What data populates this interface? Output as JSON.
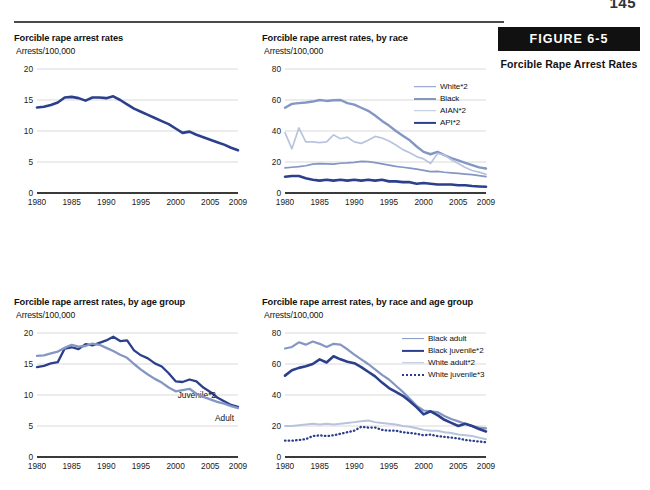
{
  "page": {
    "folio": "145"
  },
  "figure": {
    "bar_label": "FIGURE 6-5",
    "caption": "Forcible Rape Arrest Rates"
  },
  "colors": {
    "dark_navy": "#2B3F8C",
    "medium_blue": "#8496C4",
    "light_blue": "#B8C4DE",
    "axis": "#3a3a3a",
    "gridline": "#d9d9d9"
  },
  "charts": [
    {
      "id": "overall",
      "title": "Forcible rape arrest rates",
      "subtitle": "Arrests/100,000",
      "chart_data": {
        "type": "line",
        "title": "Forcible rape arrest rates",
        "xlabel": "",
        "ylabel": "Arrests/100,000",
        "xlim": [
          1980,
          2009
        ],
        "ylim": [
          0,
          20
        ],
        "yticks": [
          0,
          5,
          10,
          15,
          20
        ],
        "xticks": [
          1980,
          1985,
          1990,
          1995,
          2000,
          2005,
          2009
        ],
        "grid": true,
        "legend": "none",
        "x": [
          1980,
          1981,
          1982,
          1983,
          1984,
          1985,
          1986,
          1987,
          1988,
          1989,
          1990,
          1991,
          1992,
          1993,
          1994,
          1995,
          1996,
          1997,
          1998,
          1999,
          2000,
          2001,
          2002,
          2003,
          2004,
          2005,
          2006,
          2007,
          2008,
          2009
        ],
        "series": [
          {
            "name": "All",
            "color": "#2B3F8C",
            "style": "solid",
            "width": 2.6,
            "values": [
              13.8,
              13.9,
              14.2,
              14.6,
              15.4,
              15.5,
              15.3,
              14.9,
              15.4,
              15.4,
              15.3,
              15.6,
              15.0,
              14.3,
              13.6,
              13.1,
              12.6,
              12.1,
              11.6,
              11.1,
              10.4,
              9.7,
              9.9,
              9.4,
              9.0,
              8.6,
              8.2,
              7.8,
              7.3,
              6.9
            ]
          }
        ]
      }
    },
    {
      "id": "by-race",
      "title": "Forcible rape arrest rates, by race",
      "subtitle": "Arrests/100,000",
      "chart_data": {
        "type": "line",
        "title": "Forcible rape arrest rates, by race",
        "xlabel": "",
        "ylabel": "Arrests/100,000",
        "xlim": [
          1980,
          2009
        ],
        "ylim": [
          0,
          80
        ],
        "yticks": [
          0,
          20,
          40,
          60,
          80
        ],
        "xticks": [
          1980,
          1985,
          1990,
          1995,
          2000,
          2005,
          2009
        ],
        "grid": true,
        "legend": "top-right",
        "x": [
          1980,
          1981,
          1982,
          1983,
          1984,
          1985,
          1986,
          1987,
          1988,
          1989,
          1990,
          1991,
          1992,
          1993,
          1994,
          1995,
          1996,
          1997,
          1998,
          1999,
          2000,
          2001,
          2002,
          2003,
          2004,
          2005,
          2006,
          2007,
          2008,
          2009
        ],
        "series": [
          {
            "name": "White*2",
            "color": "#8496C4",
            "style": "solid",
            "width": 1.7,
            "values": [
              16.2,
              16.6,
              17.0,
              17.6,
              18.6,
              19.0,
              18.8,
              18.6,
              19.2,
              19.4,
              19.8,
              20.4,
              20.2,
              19.6,
              18.8,
              18.0,
              17.2,
              16.6,
              16.0,
              15.4,
              14.6,
              13.8,
              14.0,
              13.4,
              13.0,
              12.6,
              12.2,
              11.8,
              11.2,
              10.6
            ]
          },
          {
            "name": "Black",
            "color": "#8496C4",
            "style": "solid",
            "width": 2.4,
            "values": [
              55.0,
              57.5,
              58.0,
              58.4,
              59.0,
              60.0,
              59.4,
              59.8,
              60.0,
              58.0,
              57.0,
              55.0,
              53.0,
              50.0,
              46.5,
              43.5,
              40.0,
              37.0,
              34.0,
              30.0,
              26.5,
              25.0,
              26.5,
              24.5,
              22.5,
              21.0,
              19.5,
              18.0,
              16.5,
              15.8
            ]
          },
          {
            "name": "AIAN*2",
            "color": "#B8C4DE",
            "style": "solid",
            "width": 1.7,
            "values": [
              39.0,
              28.5,
              42.0,
              33.0,
              33.0,
              32.5,
              33.0,
              37.5,
              35.0,
              36.0,
              33.0,
              32.0,
              34.0,
              36.5,
              35.5,
              33.5,
              31.0,
              28.0,
              26.0,
              23.5,
              22.0,
              19.0,
              25.5,
              24.5,
              21.5,
              19.0,
              16.5,
              14.5,
              13.5,
              12.0
            ]
          },
          {
            "name": "API*2",
            "color": "#2B3F8C",
            "style": "solid",
            "width": 2.6,
            "values": [
              10.5,
              11.0,
              11.0,
              9.5,
              8.5,
              8.0,
              8.5,
              8.0,
              8.5,
              8.0,
              8.5,
              8.0,
              8.5,
              8.0,
              8.5,
              7.5,
              7.5,
              7.0,
              7.0,
              6.0,
              6.5,
              6.0,
              5.5,
              5.5,
              5.5,
              5.0,
              5.0,
              4.5,
              4.2,
              4.0
            ]
          }
        ]
      }
    },
    {
      "id": "by-age",
      "title": "Forcible rape arrest rates, by age group",
      "subtitle": "Arrests/100,000",
      "chart_data": {
        "type": "line",
        "title": "Forcible rape arrest rates, by age group",
        "xlabel": "",
        "ylabel": "Arrests/100,000",
        "xlim": [
          1980,
          2009
        ],
        "ylim": [
          0,
          20
        ],
        "yticks": [
          0,
          5,
          10,
          15,
          20
        ],
        "xticks": [
          1980,
          1985,
          1990,
          1995,
          2000,
          2005,
          2009
        ],
        "grid": true,
        "legend": "inline",
        "x": [
          1980,
          1981,
          1982,
          1983,
          1984,
          1985,
          1986,
          1987,
          1988,
          1989,
          1990,
          1991,
          1992,
          1993,
          1994,
          1995,
          1996,
          1997,
          1998,
          1999,
          2000,
          2001,
          2002,
          2003,
          2004,
          2005,
          2006,
          2007,
          2008,
          2009
        ],
        "series": [
          {
            "name": "Juvenile*2",
            "color": "#2B3F8C",
            "style": "solid",
            "width": 2.3,
            "label_inline": "Juvenile*2",
            "values": [
              14.5,
              14.7,
              15.1,
              15.3,
              17.5,
              17.7,
              17.4,
              18.2,
              18.0,
              18.4,
              18.8,
              19.4,
              18.7,
              18.8,
              17.2,
              16.4,
              15.9,
              15.1,
              14.6,
              13.5,
              12.2,
              12.1,
              12.5,
              12.2,
              11.2,
              10.5,
              9.6,
              9.0,
              8.4,
              8.1
            ]
          },
          {
            "name": "Adult",
            "color": "#8496C4",
            "style": "solid",
            "width": 2.3,
            "label_inline": "Adult",
            "values": [
              16.3,
              16.4,
              16.7,
              17.0,
              17.6,
              18.1,
              17.8,
              17.9,
              18.3,
              18.1,
              17.6,
              17.1,
              16.5,
              16.0,
              15.0,
              14.1,
              13.3,
              12.6,
              12.0,
              11.2,
              10.6,
              10.8,
              11.0,
              10.2,
              9.7,
              9.3,
              8.9,
              8.6,
              8.2,
              7.9
            ]
          }
        ]
      }
    },
    {
      "id": "by-race-age",
      "title": "Forcible rape arrest rates, by race and age group",
      "subtitle": "Arrests/100,000",
      "chart_data": {
        "type": "line",
        "title": "Forcible rape arrest rates, by race and age group",
        "xlabel": "",
        "ylabel": "Arrests/100,000",
        "xlim": [
          1980,
          2009
        ],
        "ylim": [
          0,
          80
        ],
        "yticks": [
          0,
          20,
          40,
          60,
          80
        ],
        "xticks": [
          1980,
          1985,
          1990,
          1995,
          2000,
          2005,
          2009
        ],
        "grid": true,
        "legend": "top-right",
        "x": [
          1980,
          1981,
          1982,
          1983,
          1984,
          1985,
          1986,
          1987,
          1988,
          1989,
          1990,
          1991,
          1992,
          1993,
          1994,
          1995,
          1996,
          1997,
          1998,
          1999,
          2000,
          2001,
          2002,
          2003,
          2004,
          2005,
          2006,
          2007,
          2008,
          2009
        ],
        "series": [
          {
            "name": "Black adult",
            "color": "#8496C4",
            "style": "solid",
            "width": 2.2,
            "values": [
              70.0,
              71.0,
              74.0,
              72.5,
              74.5,
              73.0,
              71.0,
              73.0,
              72.5,
              69.5,
              66.0,
              63.0,
              60.0,
              56.5,
              53.0,
              50.0,
              46.0,
              42.0,
              37.5,
              33.0,
              30.0,
              29.5,
              29.0,
              26.5,
              24.5,
              23.0,
              21.5,
              20.0,
              19.0,
              18.5
            ]
          },
          {
            "name": "Black juvenile*2",
            "color": "#2B3F8C",
            "style": "solid",
            "width": 2.6,
            "values": [
              52.5,
              56.0,
              57.5,
              58.5,
              60.0,
              63.0,
              61.0,
              65.0,
              63.0,
              61.5,
              60.5,
              58.0,
              55.0,
              52.0,
              48.0,
              44.5,
              42.0,
              39.5,
              36.0,
              32.0,
              27.5,
              29.5,
              27.0,
              24.0,
              22.0,
              20.0,
              21.5,
              20.0,
              18.0,
              16.5
            ]
          },
          {
            "name": "White adult*2",
            "color": "#B8C4DE",
            "style": "solid",
            "width": 2.0,
            "values": [
              20.0,
              20.0,
              20.5,
              21.0,
              21.5,
              21.0,
              21.5,
              21.0,
              21.5,
              22.0,
              22.5,
              23.0,
              23.5,
              22.5,
              22.0,
              21.5,
              21.0,
              20.0,
              19.5,
              18.5,
              17.5,
              17.0,
              17.0,
              16.0,
              15.5,
              14.5,
              14.0,
              13.5,
              12.5,
              11.5
            ]
          },
          {
            "name": "White juvenile*3",
            "color": "#2B3F8C",
            "style": "dotted",
            "width": 2.3,
            "values": [
              10.5,
              10.5,
              11.0,
              11.5,
              13.5,
              14.0,
              13.5,
              14.0,
              15.0,
              16.0,
              17.0,
              19.5,
              19.0,
              19.0,
              17.5,
              17.0,
              17.0,
              16.0,
              15.5,
              15.0,
              14.0,
              14.5,
              13.5,
              13.0,
              12.5,
              12.0,
              11.0,
              10.5,
              10.0,
              9.5
            ]
          }
        ]
      }
    }
  ]
}
